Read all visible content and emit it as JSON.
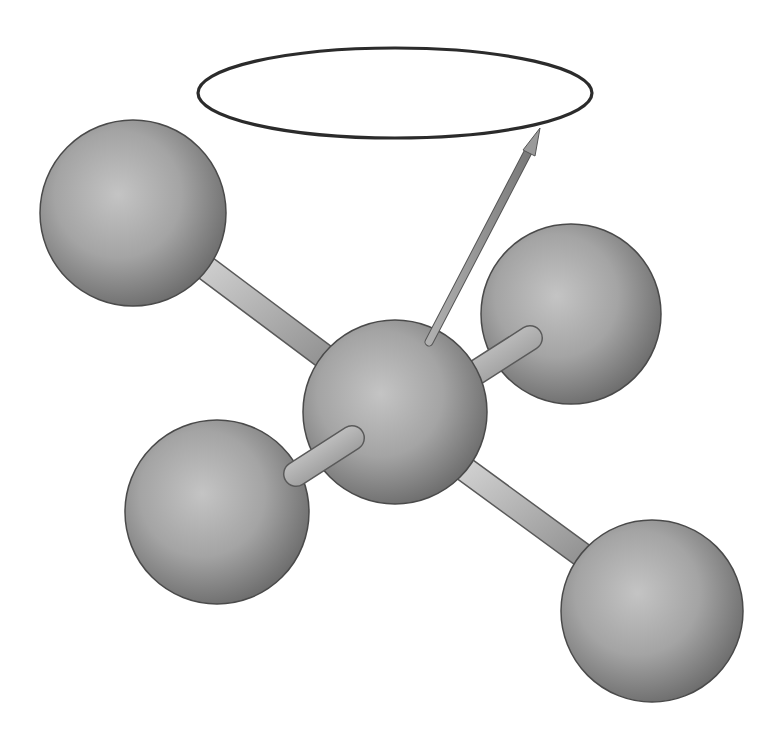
{
  "diagram": {
    "type": "ball-and-stick molecular model",
    "colors": {
      "background": "#ffffff",
      "atom_light": "#c4c4c4",
      "atom_mid": "#9c9c9c",
      "atom_dark": "#6e6e6e",
      "atom_outline": "#4a4a4a",
      "bond_light": "#d0d0d0",
      "bond_dark": "#8a8a8a",
      "ellipse_stroke": "#2b2b2b",
      "arrow": "#8c8c8c"
    },
    "ellipse": {
      "cx": 395,
      "cy": 93,
      "rx": 197,
      "ry": 45,
      "label": "precession-cone-ellipse"
    },
    "arrow": {
      "x1": 428,
      "y1": 344,
      "x2": 540,
      "y2": 128,
      "label": "spin-vector-arrow"
    },
    "atoms": [
      {
        "id": "central",
        "cx": 395,
        "cy": 412,
        "r": 92
      },
      {
        "id": "upper-left",
        "cx": 133,
        "cy": 213,
        "r": 93
      },
      {
        "id": "upper-right",
        "cx": 571,
        "cy": 314,
        "r": 90
      },
      {
        "id": "lower-left",
        "cx": 217,
        "cy": 512,
        "r": 92
      },
      {
        "id": "lower-right",
        "cx": 652,
        "cy": 611,
        "r": 91
      }
    ],
    "bonds": [
      {
        "from": "central",
        "to": "upper-left",
        "x1": 340,
        "y1": 368,
        "x2": 200,
        "y2": 264
      },
      {
        "from": "central",
        "to": "upper-right",
        "x1": 470,
        "y1": 376,
        "x2": 526,
        "y2": 340
      },
      {
        "from": "central",
        "to": "lower-left",
        "x1": 352,
        "y1": 436,
        "x2": 300,
        "y2": 470
      },
      {
        "from": "central",
        "to": "lower-right",
        "x1": 462,
        "y1": 468,
        "x2": 588,
        "y2": 560
      }
    ]
  }
}
